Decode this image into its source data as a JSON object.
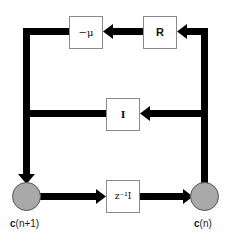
{
  "diagram": {
    "type": "block-diagram",
    "colors": {
      "line": "#000000",
      "box_border": "#8a8a8a",
      "box_fill": "#ffffff",
      "node_fill": "#a9a9a9",
      "node_border": "#555555"
    },
    "blocks": [
      {
        "id": "neg-mu",
        "label": "−μ"
      },
      {
        "id": "R",
        "label": "R"
      },
      {
        "id": "I",
        "label": "I"
      },
      {
        "id": "delay",
        "label": "z⁻¹I"
      }
    ],
    "nodes": [
      {
        "id": "c-next",
        "label": "c(n+1)",
        "label_prefix": "c",
        "label_arg": "(n+1)"
      },
      {
        "id": "c-now",
        "label": "c(n)",
        "label_prefix": "c",
        "label_arg": "(n)"
      }
    ],
    "edges": [
      {
        "from": "c-now",
        "to": "R"
      },
      {
        "from": "R",
        "to": "neg-mu"
      },
      {
        "from": "neg-mu",
        "to": "c-next"
      },
      {
        "from": "c-now",
        "to": "I"
      },
      {
        "from": "I",
        "to": "c-next"
      },
      {
        "from": "c-next",
        "to": "delay"
      },
      {
        "from": "delay",
        "to": "c-now"
      }
    ]
  }
}
